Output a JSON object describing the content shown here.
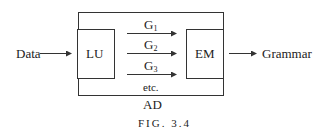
{
  "diagram": {
    "input_label": "Data",
    "output_label": "Grammar",
    "outer_box_label": "AD",
    "left_box_label": "LU",
    "right_box_label": "EM",
    "arrows": [
      {
        "letter": "G",
        "subscript": "1"
      },
      {
        "letter": "G",
        "subscript": "2"
      },
      {
        "letter": "G",
        "subscript": "3"
      }
    ],
    "etc_label": "etc.",
    "caption": "FIG. 3.4"
  }
}
